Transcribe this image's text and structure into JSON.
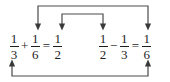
{
  "diagram": {
    "type": "fraction-equation-arrow-diagram",
    "width": 170,
    "height": 82,
    "background_color": "#ffffff",
    "ink_color": "#1d1d1d",
    "arrow_color": "#4a4a4a"
  },
  "equations": {
    "left": {
      "id": "equation-left",
      "text": "1/3 + 1/6 = 1/2",
      "terms": [
        {
          "role": "first-addend",
          "numerator": "1",
          "denominator": "3"
        },
        {
          "role": "operator",
          "symbol": "+"
        },
        {
          "role": "second-addend",
          "numerator": "1",
          "denominator": "6"
        },
        {
          "role": "equals",
          "symbol": "="
        },
        {
          "role": "result",
          "numerator": "1",
          "denominator": "2"
        }
      ]
    },
    "right": {
      "id": "equation-right",
      "text": "1/2 - 1/3 = 1/6",
      "terms": [
        {
          "role": "minuend",
          "numerator": "1",
          "denominator": "2"
        },
        {
          "role": "operator",
          "symbol": "−"
        },
        {
          "role": "subtrahend",
          "numerator": "1",
          "denominator": "3"
        },
        {
          "role": "equals",
          "symbol": "="
        },
        {
          "role": "result",
          "numerator": "1",
          "denominator": "6"
        }
      ]
    }
  },
  "arrows": [
    {
      "id": "arrow-outer-top",
      "style": "bracket-down-both-ends",
      "description": "connects 1/6 of left equation to 1/6 result of right equation",
      "from_x": 38,
      "to_x": 148,
      "bar_y": 6,
      "tip_y": 28
    },
    {
      "id": "arrow-inner-top",
      "style": "bracket-down-both-ends",
      "description": "connects 1/2 result of left equation to 1/2 minuend of right equation",
      "from_x": 62,
      "to_x": 103,
      "bar_y": 14,
      "tip_y": 28
    },
    {
      "id": "arrow-bottom",
      "style": "bracket-up-both-ends",
      "description": "connects 1/3 of left equation to 1/3 subtrahend of right equation",
      "from_x": 12,
      "to_x": 148,
      "bar_y": 76,
      "tip_y": 62
    }
  ]
}
